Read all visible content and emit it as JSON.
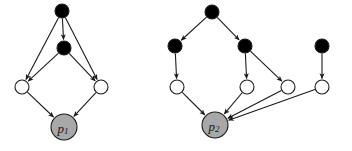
{
  "figure": {
    "title": "",
    "width": 352,
    "height": 151,
    "background": "#ffffff"
  },
  "style": {
    "observed_fill": "#000000",
    "latent_fill": "#ffffff",
    "target_fill": "#a8a8a8",
    "node_stroke": "#1a1a1a",
    "edge_stroke": "#1a1a1a",
    "node_stroke_width": 1.1,
    "edge_stroke_width": 1.1,
    "small_radius": 7,
    "target_radius": 13
  },
  "graphs": [
    {
      "id": "graph-p1",
      "target_label": "p",
      "target_subscript": "1",
      "nodes": [
        {
          "id": "g1n1",
          "kind": "filled",
          "cx": 62,
          "cy": 11,
          "r": 7,
          "label": ""
        },
        {
          "id": "g1n2",
          "kind": "filled",
          "cx": 64,
          "cy": 48,
          "r": 7,
          "label": ""
        },
        {
          "id": "g1n3",
          "kind": "open",
          "cx": 22,
          "cy": 87,
          "r": 7,
          "label": ""
        },
        {
          "id": "g1n4",
          "kind": "open",
          "cx": 101,
          "cy": 87,
          "r": 7,
          "label": ""
        },
        {
          "id": "g1n5",
          "kind": "target",
          "cx": 64,
          "cy": 127,
          "r": 13,
          "label": "p1"
        }
      ],
      "edges": [
        {
          "from": "g1n1",
          "to": "g1n2"
        },
        {
          "from": "g1n1",
          "to": "g1n3"
        },
        {
          "from": "g1n1",
          "to": "g1n4"
        },
        {
          "from": "g1n2",
          "to": "g1n3"
        },
        {
          "from": "g1n2",
          "to": "g1n4"
        },
        {
          "from": "g1n3",
          "to": "g1n5"
        },
        {
          "from": "g1n4",
          "to": "g1n5"
        }
      ]
    },
    {
      "id": "graph-p2",
      "target_label": "p",
      "target_subscript": "2",
      "nodes": [
        {
          "id": "g2n1",
          "kind": "filled",
          "cx": 212,
          "cy": 12,
          "r": 7,
          "label": ""
        },
        {
          "id": "g2n2",
          "kind": "filled",
          "cx": 175,
          "cy": 46,
          "r": 7,
          "label": ""
        },
        {
          "id": "g2n3",
          "kind": "filled",
          "cx": 245,
          "cy": 46,
          "r": 7,
          "label": ""
        },
        {
          "id": "g2n4",
          "kind": "filled",
          "cx": 322,
          "cy": 46,
          "r": 7,
          "label": ""
        },
        {
          "id": "g2n5",
          "kind": "open",
          "cx": 177,
          "cy": 87,
          "r": 7,
          "label": ""
        },
        {
          "id": "g2n6",
          "kind": "open",
          "cx": 247,
          "cy": 87,
          "r": 7,
          "label": ""
        },
        {
          "id": "g2n7",
          "kind": "open",
          "cx": 288,
          "cy": 87,
          "r": 7,
          "label": ""
        },
        {
          "id": "g2n8",
          "kind": "open",
          "cx": 322,
          "cy": 87,
          "r": 7,
          "label": ""
        },
        {
          "id": "g2n9",
          "kind": "target",
          "cx": 215,
          "cy": 125,
          "r": 13,
          "label": "p2"
        }
      ],
      "edges": [
        {
          "from": "g2n1",
          "to": "g2n2"
        },
        {
          "from": "g2n1",
          "to": "g2n3"
        },
        {
          "from": "g2n2",
          "to": "g2n5"
        },
        {
          "from": "g2n3",
          "to": "g2n6"
        },
        {
          "from": "g2n3",
          "to": "g2n7"
        },
        {
          "from": "g2n4",
          "to": "g2n8"
        },
        {
          "from": "g2n5",
          "to": "g2n9"
        },
        {
          "from": "g2n6",
          "to": "g2n9"
        },
        {
          "from": "g2n7",
          "to": "g2n9"
        },
        {
          "from": "g2n8",
          "to": "g2n9"
        }
      ]
    }
  ]
}
